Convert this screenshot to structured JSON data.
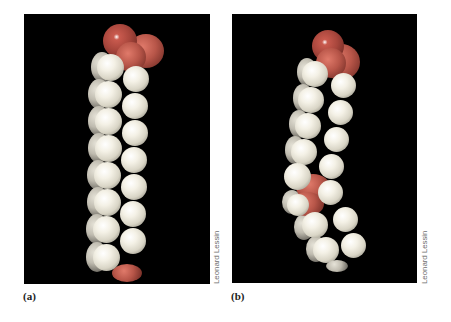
{
  "figure": {
    "panels": [
      {
        "id": "a",
        "label": "(a)",
        "credit": "Leonard Lessin",
        "description": "Space-filling model of a saturated fatty acid (straight chain)",
        "atom_colors": {
          "hydrogen": "#f4f1e6",
          "oxygen": "#a8463c",
          "carbon": "#b85649",
          "background": "#000000"
        }
      },
      {
        "id": "b",
        "label": "(b)",
        "credit": "Leonard Lessin",
        "description": "Space-filling model of an unsaturated fatty acid (bent chain at cis double bond)",
        "atom_colors": {
          "hydrogen": "#f4f1e6",
          "oxygen": "#a8463c",
          "carbon": "#b85649",
          "background": "#000000"
        }
      }
    ]
  }
}
